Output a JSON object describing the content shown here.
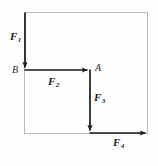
{
  "figure": {
    "type": "force-vector-diagram",
    "width": 158,
    "height": 166,
    "background_color": "#fefefe",
    "frame": {
      "name": "reference-rectangle",
      "color": "#b9b9b5",
      "x": 24,
      "y": 12,
      "width": 124,
      "height": 122
    },
    "arrow_color": "#1a1a1a",
    "label_color": "#1a1a1a",
    "forces": [
      {
        "id": "F1",
        "label": "F",
        "subscript": "1",
        "direction": "down",
        "from": [
          25,
          12
        ],
        "to": [
          25,
          70
        ],
        "label_x": 10,
        "label_y": 31
      },
      {
        "id": "F2",
        "label": "F",
        "subscript": "2",
        "direction": "right",
        "from": [
          25,
          70
        ],
        "to": [
          90,
          70
        ],
        "label_x": 48,
        "label_y": 76
      },
      {
        "id": "F3",
        "label": "F",
        "subscript": "3",
        "direction": "down",
        "from": [
          90,
          70
        ],
        "to": [
          90,
          133
        ],
        "label_x": 94,
        "label_y": 92
      },
      {
        "id": "F4",
        "label": "F",
        "subscript": "4",
        "direction": "right",
        "from": [
          90,
          133
        ],
        "to": [
          148,
          133
        ],
        "label_x": 113,
        "label_y": 137
      }
    ],
    "points": [
      {
        "id": "B",
        "label": "B",
        "x": 12,
        "y": 65
      },
      {
        "id": "A",
        "label": "A",
        "x": 95,
        "y": 63
      }
    ]
  }
}
